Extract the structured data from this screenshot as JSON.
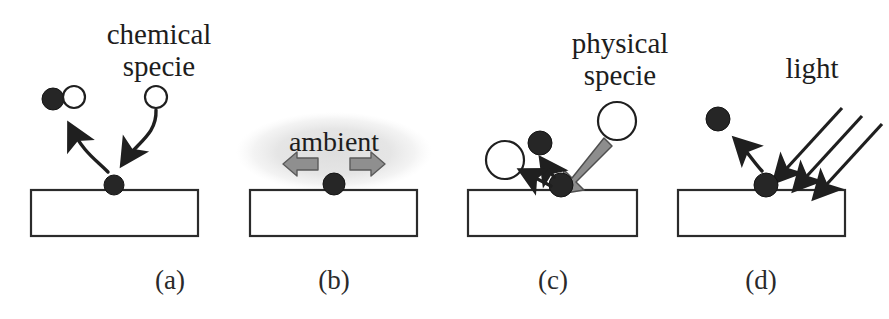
{
  "figure": {
    "background_color": "#ffffff",
    "ink_color": "#1f1f1f",
    "gray_accent_color": "#8c8c8c",
    "cloud_color": "#e8e8e8"
  },
  "panels": [
    {
      "id": "a",
      "caption": "(a)",
      "label": "chemical specie",
      "label_line1": "chemical",
      "label_line2": "specie",
      "mechanism": "chemical-reaction"
    },
    {
      "id": "b",
      "caption": "(b)",
      "label": "ambient",
      "mechanism": "ambient-diffusion"
    },
    {
      "id": "c",
      "caption": "(c)",
      "label": "physical specie",
      "label_line1": "physical",
      "label_line2": "specie",
      "mechanism": "physical-sputtering"
    },
    {
      "id": "d",
      "caption": "(d)",
      "label": "light",
      "mechanism": "photo-desorption"
    }
  ]
}
